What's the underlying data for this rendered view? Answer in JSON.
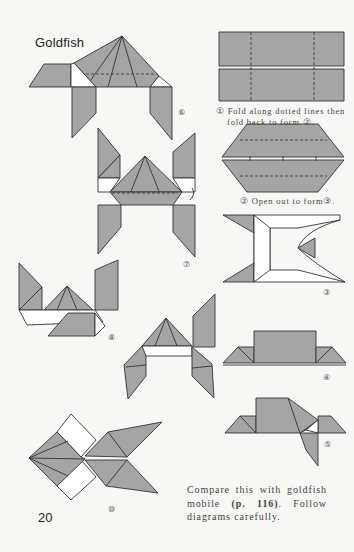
{
  "page": {
    "title": "Goldfish",
    "page_number": "20",
    "colors": {
      "paper": "#f7f7f5",
      "fold_gray": "#a5a5a5",
      "line": "#333333"
    }
  },
  "steps": [
    {
      "id": "1",
      "label": "①",
      "caption_line1": "Fold along dotted lines then",
      "caption_line2": "fold back to form ②."
    },
    {
      "id": "2",
      "label": "②",
      "caption": "Open out to form③."
    },
    {
      "id": "3",
      "label": "③"
    },
    {
      "id": "4",
      "label": "④"
    },
    {
      "id": "5",
      "label": "⑤"
    },
    {
      "id": "6",
      "label": "⑥"
    },
    {
      "id": "7",
      "label": "⑦"
    },
    {
      "id": "8",
      "label": "⑧"
    },
    {
      "id": "9",
      "label": ""
    },
    {
      "id": "10",
      "label": "⑩"
    }
  ],
  "note": {
    "text_part1": "Compare this with goldfish mobile ",
    "ref": "(p. 116)",
    "text_part2": ". Follow diagrams carefully."
  }
}
